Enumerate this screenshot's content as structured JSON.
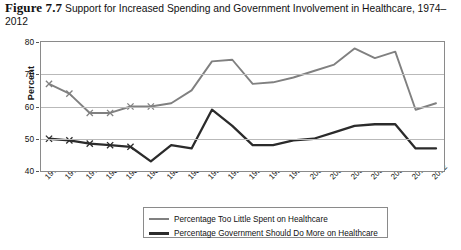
{
  "figure": {
    "label": "Figure 7.7",
    "title": "Support for Increased Spending and Government Involvement in Healthcare, 1974–2012"
  },
  "axes": {
    "y_title": "Percent",
    "y_ticks": [
      "80",
      "70",
      "60",
      "50",
      "40"
    ],
    "y_min": 40,
    "y_max": 80,
    "x_ticks": [
      "1974",
      "1976",
      "1978",
      "1980",
      "1982",
      "1984",
      "1986",
      "1988",
      "1990",
      "1992",
      "1994",
      "1996",
      "1998",
      "2000",
      "2002",
      "2004",
      "2006",
      "2008",
      "2010",
      "2012"
    ]
  },
  "legend": {
    "items": [
      {
        "label": "Percentage Too Little Spent on Healthcare",
        "color": "#808080"
      },
      {
        "label": "Percentage Government Should Do More on Healthcare",
        "color": "#2b2b2b"
      }
    ]
  },
  "footnote": "",
  "chart_data": {
    "type": "line",
    "title": "Support for Increased Spending and Government Involvement in Healthcare, 1974–2012",
    "xlabel": "",
    "ylabel": "Percent",
    "ylim": [
      40,
      80
    ],
    "grid": true,
    "legend_position": "bottom",
    "x": [
      1974,
      1976,
      1978,
      1980,
      1982,
      1984,
      1986,
      1988,
      1990,
      1992,
      1994,
      1996,
      1998,
      2000,
      2002,
      2004,
      2006,
      2008,
      2010,
      2012
    ],
    "series": [
      {
        "name": "Percentage Too Little Spent on Healthcare",
        "color": "#808080",
        "markers": [
          true,
          true,
          true,
          true,
          true,
          true,
          false,
          false,
          false,
          false,
          false,
          false,
          false,
          false,
          false,
          false,
          false,
          false,
          false,
          false
        ],
        "values": [
          67,
          64,
          58,
          58,
          60,
          60,
          61,
          65,
          74,
          74.5,
          67,
          67.5,
          69,
          71,
          73,
          78,
          75,
          77,
          59,
          61
        ]
      },
      {
        "name": "Percentage Government Should Do More on Healthcare",
        "color": "#2b2b2b",
        "markers": [
          true,
          true,
          true,
          true,
          true,
          false,
          false,
          false,
          false,
          false,
          false,
          false,
          false,
          false,
          false,
          false,
          false,
          false,
          false,
          false
        ],
        "values": [
          50,
          49.5,
          48.5,
          48,
          47.5,
          43,
          48,
          47,
          59,
          54,
          48,
          48,
          49.5,
          50,
          52,
          54,
          54.5,
          54.5,
          47,
          47
        ]
      }
    ]
  }
}
